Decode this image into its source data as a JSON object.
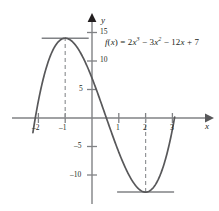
{
  "figure": {
    "formula_parts": {
      "fname": "f",
      "open": "(",
      "var": "x",
      "close": ")",
      "equals": " = ",
      "t1_coef": "2",
      "t1_var": "x",
      "t1_exp": "3",
      "t2_op": " − ",
      "t2_coef": "3",
      "t2_var": "x",
      "t2_exp": "2",
      "t3_op": " − ",
      "t3_coef": "12",
      "t3_var": "x",
      "t4_op": " + ",
      "t4_const": "7"
    },
    "axis_labels": {
      "x": "x",
      "y": "y"
    },
    "x_ticks": [
      {
        "value": -2,
        "label": "–2"
      },
      {
        "value": -1,
        "label": "–1"
      },
      {
        "value": 1,
        "label": "1"
      },
      {
        "value": 2,
        "label": "2"
      },
      {
        "value": 3,
        "label": "3"
      }
    ],
    "y_ticks": [
      {
        "value": 15,
        "label": "15"
      },
      {
        "value": 10,
        "label": "10"
      },
      {
        "value": 5,
        "label": "5"
      },
      {
        "value": -5,
        "label": "–5"
      },
      {
        "value": -10,
        "label": "–10"
      }
    ],
    "colors": {
      "curve": "#58585a",
      "axis": "#808285",
      "tangent": "#808285",
      "dashed": "#939598",
      "text": "#231f20"
    }
  },
  "chart_data": {
    "type": "line",
    "title": "",
    "xlabel": "x",
    "ylabel": "y",
    "function": "f(x) = 2x^3 - 3x^2 - 12x + 7",
    "coefficients": {
      "x3": 2,
      "x2": -3,
      "x1": -12,
      "x0": 7
    },
    "xlim": [
      -2.3,
      3.4
    ],
    "ylim": [
      -15,
      17
    ],
    "grid": false,
    "legend": "none",
    "x_tick_values": [
      -2,
      -1,
      1,
      2,
      3
    ],
    "y_tick_values": [
      15,
      10,
      5,
      -5,
      -10
    ],
    "critical_points": [
      {
        "kind": "local maximum",
        "x": -1,
        "y": 14
      },
      {
        "kind": "local minimum",
        "x": 2,
        "y": -13
      }
    ],
    "annotations": [
      {
        "kind": "horizontal tangent",
        "at_x": -1,
        "y": 14
      },
      {
        "kind": "horizontal tangent",
        "at_x": 2,
        "y": -13
      },
      {
        "kind": "vertical dashed line",
        "at_x": -1,
        "from_y": 0,
        "to_y": 14
      },
      {
        "kind": "vertical dashed line",
        "at_x": 2,
        "from_y": 0,
        "to_y": -13
      }
    ],
    "x": [
      -2.2,
      -2.1,
      -2.0,
      -1.9,
      -1.8,
      -1.7,
      -1.6,
      -1.5,
      -1.4,
      -1.3,
      -1.2,
      -1.1,
      -1.0,
      -0.9,
      -0.8,
      -0.7,
      -0.6,
      -0.5,
      -0.4,
      -0.3,
      -0.2,
      -0.1,
      0.0,
      0.1,
      0.2,
      0.3,
      0.4,
      0.5,
      0.6,
      0.7,
      0.8,
      0.9,
      1.0,
      1.1,
      1.2,
      1.3,
      1.4,
      1.5,
      1.6,
      1.7,
      1.8,
      1.9,
      2.0,
      2.1,
      2.2,
      2.3,
      2.4,
      2.5,
      2.6,
      2.7,
      2.8,
      2.9,
      3.0,
      3.1
    ],
    "y": [
      2.26,
      5.15,
      7.0,
      9.43,
      11.26,
      12.55,
      13.36,
      13.75,
      13.78,
      13.51,
      13.0,
      12.31,
      14.0,
      12.98,
      13.42,
      13.73,
      13.9,
      13.0,
      12.29,
      10.31,
      9.27,
      8.12,
      7.0,
      5.77,
      4.52,
      3.25,
      1.97,
      0.69,
      -0.58,
      -1.83,
      -3.06,
      -4.27,
      -5.44,
      -6.57,
      -7.66,
      -8.7,
      -9.68,
      -10.6,
      -11.45,
      -12.22,
      -12.91,
      -13.51,
      -13.0,
      -12.92,
      -12.39,
      -11.72,
      -10.9,
      -9.94,
      -8.81,
      -7.51,
      -6.03,
      -4.37,
      -2.51,
      -0.45
    ]
  }
}
